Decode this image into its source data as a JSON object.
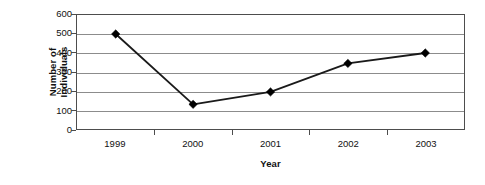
{
  "chart_data": {
    "type": "line",
    "title": "",
    "xlabel": "Year",
    "ylabel": "Number of Individuals",
    "ylabel_lines": [
      "Number of",
      "Individuals"
    ],
    "categories": [
      "1999",
      "2000",
      "2001",
      "2002",
      "2003"
    ],
    "values": [
      500,
      130,
      195,
      345,
      400
    ],
    "series": [
      {
        "name": "Number of Individuals",
        "values": [
          500,
          130,
          195,
          345,
          400
        ]
      }
    ],
    "ylim": [
      0,
      600
    ],
    "ytick_values": [
      600,
      500,
      400,
      300,
      200,
      100,
      0
    ],
    "ytick_labels": [
      "600",
      "500",
      "400",
      "300",
      "200",
      "100",
      "0"
    ],
    "grid": "horizontal",
    "legend": "none",
    "marker": "diamond",
    "marker_color": "#000000",
    "line_color": "#1a1a1a",
    "gridline_color": "#8c8c8c",
    "axis_color": "#4d4d4d",
    "background_color": "#ffffff",
    "annotations": []
  }
}
